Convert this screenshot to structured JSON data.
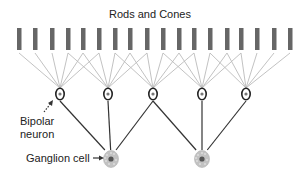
{
  "title": "Rods and Cones",
  "labels": {
    "bipolar_line1": "Bipolar",
    "bipolar_line2": "neuron",
    "ganglion": "Ganglion cell"
  },
  "colors": {
    "rod": "#666666",
    "rod_line": "#bbbbbb",
    "bipolar_outline": "#222222",
    "bipolar_nucleus": "#777777",
    "axon": "#333333",
    "ganglion_fill": "#c2c2c2",
    "ganglion_nucleus": "#555555",
    "text": "#222222"
  },
  "rods": [
    {
      "x": 19
    },
    {
      "x": 35
    },
    {
      "x": 52
    },
    {
      "x": 68
    },
    {
      "x": 83
    },
    {
      "x": 99
    },
    {
      "x": 115
    },
    {
      "x": 130
    },
    {
      "x": 147
    },
    {
      "x": 163
    },
    {
      "x": 179
    },
    {
      "x": 194
    },
    {
      "x": 210
    },
    {
      "x": 227
    },
    {
      "x": 241
    },
    {
      "x": 257
    },
    {
      "x": 274
    },
    {
      "x": 290
    }
  ],
  "bipolar_neurons": [
    {
      "x": 60,
      "y": 94,
      "rods": [
        0,
        1,
        2,
        3,
        4,
        5
      ]
    },
    {
      "x": 108,
      "y": 94,
      "rods": [
        3,
        4,
        5,
        6,
        7,
        8
      ]
    },
    {
      "x": 153,
      "y": 94,
      "rods": [
        6,
        7,
        8,
        9,
        10,
        11
      ]
    },
    {
      "x": 202,
      "y": 94,
      "rods": [
        9,
        10,
        11,
        12,
        13,
        14
      ]
    },
    {
      "x": 246,
      "y": 94,
      "rods": [
        12,
        13,
        14,
        15,
        16,
        17
      ]
    }
  ],
  "ganglion_cells": [
    {
      "x": 111,
      "y": 159,
      "bipolars": [
        0,
        1,
        2
      ]
    },
    {
      "x": 202,
      "y": 159,
      "bipolars": [
        2,
        3,
        4
      ]
    }
  ]
}
